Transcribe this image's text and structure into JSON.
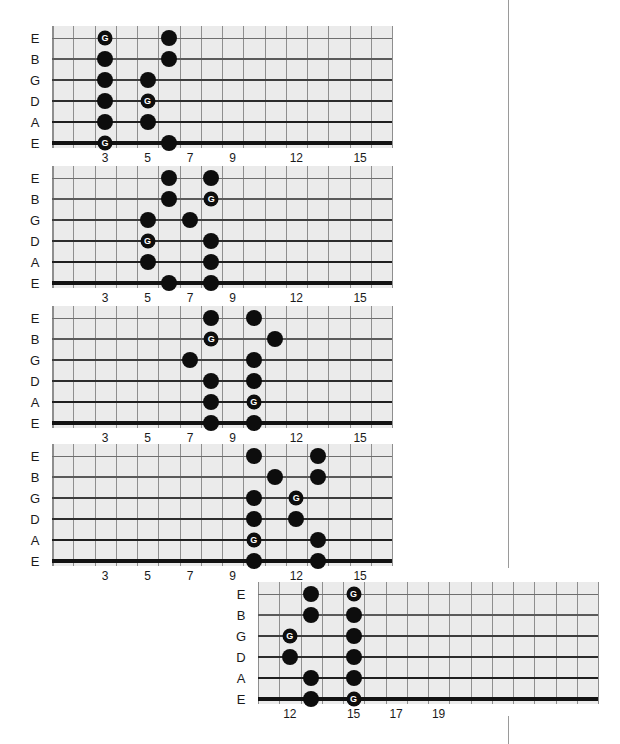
{
  "page": {
    "background_color": "#ffffff",
    "divider_color": "#9a9a9a",
    "board_color": "#ebebeb",
    "dot_color": "#0d0d0d",
    "root_label_color": "#ffffff",
    "string_color": "#232323",
    "fret_color": "#8e8e8e"
  },
  "dividers": [
    {
      "name": "page-divider-upper",
      "x": 508,
      "y": 0,
      "height": 568
    },
    {
      "name": "page-divider-lower",
      "x": 508,
      "y": 716,
      "height": 28
    }
  ],
  "string_names": [
    "E",
    "B",
    "G",
    "D",
    "A",
    "E"
  ],
  "diagrams": [
    {
      "id": "position-1",
      "name": "fretboard-diagram-1",
      "left": 24,
      "top": 26,
      "board_left": 28,
      "board_top": 0,
      "board_width": 340,
      "board_height": 122,
      "start_fret": 0,
      "fret_count": 16,
      "string_labels": [
        "E",
        "B",
        "G",
        "D",
        "A",
        "E"
      ],
      "fret_numbers": [
        {
          "fret": 3,
          "label": "3"
        },
        {
          "fret": 5,
          "label": "5"
        },
        {
          "fret": 7,
          "label": "7"
        },
        {
          "fret": 9,
          "label": "9"
        },
        {
          "fret": 12,
          "label": "12"
        },
        {
          "fret": 15,
          "label": "15"
        }
      ],
      "dots": [
        {
          "string": 1,
          "fret": 3,
          "root": true,
          "label": "G"
        },
        {
          "string": 1,
          "fret": 6,
          "root": false,
          "label": ""
        },
        {
          "string": 2,
          "fret": 3,
          "root": false,
          "label": ""
        },
        {
          "string": 2,
          "fret": 6,
          "root": false,
          "label": ""
        },
        {
          "string": 3,
          "fret": 3,
          "root": false,
          "label": ""
        },
        {
          "string": 3,
          "fret": 5,
          "root": false,
          "label": ""
        },
        {
          "string": 4,
          "fret": 3,
          "root": false,
          "label": ""
        },
        {
          "string": 4,
          "fret": 5,
          "root": true,
          "label": "G"
        },
        {
          "string": 5,
          "fret": 3,
          "root": false,
          "label": ""
        },
        {
          "string": 5,
          "fret": 5,
          "root": false,
          "label": ""
        },
        {
          "string": 6,
          "fret": 3,
          "root": true,
          "label": "G"
        },
        {
          "string": 6,
          "fret": 6,
          "root": false,
          "label": ""
        }
      ]
    },
    {
      "id": "position-2",
      "name": "fretboard-diagram-2",
      "left": 24,
      "top": 166,
      "board_left": 28,
      "board_top": 0,
      "board_width": 340,
      "board_height": 122,
      "start_fret": 0,
      "fret_count": 16,
      "string_labels": [
        "E",
        "B",
        "G",
        "D",
        "A",
        "E"
      ],
      "fret_numbers": [
        {
          "fret": 3,
          "label": "3"
        },
        {
          "fret": 5,
          "label": "5"
        },
        {
          "fret": 7,
          "label": "7"
        },
        {
          "fret": 9,
          "label": "9"
        },
        {
          "fret": 12,
          "label": "12"
        },
        {
          "fret": 15,
          "label": "15"
        }
      ],
      "dots": [
        {
          "string": 1,
          "fret": 6,
          "root": false,
          "label": ""
        },
        {
          "string": 1,
          "fret": 8,
          "root": false,
          "label": ""
        },
        {
          "string": 2,
          "fret": 6,
          "root": false,
          "label": ""
        },
        {
          "string": 2,
          "fret": 8,
          "root": true,
          "label": "G"
        },
        {
          "string": 3,
          "fret": 5,
          "root": false,
          "label": ""
        },
        {
          "string": 3,
          "fret": 7,
          "root": false,
          "label": ""
        },
        {
          "string": 4,
          "fret": 5,
          "root": true,
          "label": "G"
        },
        {
          "string": 4,
          "fret": 8,
          "root": false,
          "label": ""
        },
        {
          "string": 5,
          "fret": 5,
          "root": false,
          "label": ""
        },
        {
          "string": 5,
          "fret": 8,
          "root": false,
          "label": ""
        },
        {
          "string": 6,
          "fret": 6,
          "root": false,
          "label": ""
        },
        {
          "string": 6,
          "fret": 8,
          "root": false,
          "label": ""
        }
      ]
    },
    {
      "id": "position-3",
      "name": "fretboard-diagram-3",
      "left": 24,
      "top": 306,
      "board_left": 28,
      "board_top": 0,
      "board_width": 340,
      "board_height": 122,
      "start_fret": 0,
      "fret_count": 16,
      "string_labels": [
        "E",
        "B",
        "G",
        "D",
        "A",
        "E"
      ],
      "fret_numbers": [
        {
          "fret": 3,
          "label": "3"
        },
        {
          "fret": 5,
          "label": "5"
        },
        {
          "fret": 7,
          "label": "7"
        },
        {
          "fret": 9,
          "label": "9"
        },
        {
          "fret": 12,
          "label": "12"
        },
        {
          "fret": 15,
          "label": "15"
        }
      ],
      "dots": [
        {
          "string": 1,
          "fret": 8,
          "root": false,
          "label": ""
        },
        {
          "string": 1,
          "fret": 10,
          "root": false,
          "label": ""
        },
        {
          "string": 2,
          "fret": 8,
          "root": true,
          "label": "G"
        },
        {
          "string": 2,
          "fret": 11,
          "root": false,
          "label": ""
        },
        {
          "string": 3,
          "fret": 7,
          "root": false,
          "label": ""
        },
        {
          "string": 3,
          "fret": 10,
          "root": false,
          "label": ""
        },
        {
          "string": 4,
          "fret": 8,
          "root": false,
          "label": ""
        },
        {
          "string": 4,
          "fret": 10,
          "root": false,
          "label": ""
        },
        {
          "string": 5,
          "fret": 8,
          "root": false,
          "label": ""
        },
        {
          "string": 5,
          "fret": 10,
          "root": true,
          "label": "G"
        },
        {
          "string": 6,
          "fret": 8,
          "root": false,
          "label": ""
        },
        {
          "string": 6,
          "fret": 10,
          "root": false,
          "label": ""
        }
      ]
    },
    {
      "id": "position-4",
      "name": "fretboard-diagram-4",
      "left": 24,
      "top": 444,
      "board_left": 28,
      "board_top": 0,
      "board_width": 340,
      "board_height": 122,
      "start_fret": 0,
      "fret_count": 16,
      "string_labels": [
        "E",
        "B",
        "G",
        "D",
        "A",
        "E"
      ],
      "fret_numbers": [
        {
          "fret": 3,
          "label": "3"
        },
        {
          "fret": 5,
          "label": "5"
        },
        {
          "fret": 7,
          "label": "7"
        },
        {
          "fret": 9,
          "label": "9"
        },
        {
          "fret": 12,
          "label": "12"
        },
        {
          "fret": 15,
          "label": "15"
        }
      ],
      "dots": [
        {
          "string": 1,
          "fret": 10,
          "root": false,
          "label": ""
        },
        {
          "string": 1,
          "fret": 13,
          "root": false,
          "label": ""
        },
        {
          "string": 2,
          "fret": 11,
          "root": false,
          "label": ""
        },
        {
          "string": 2,
          "fret": 13,
          "root": false,
          "label": ""
        },
        {
          "string": 3,
          "fret": 10,
          "root": false,
          "label": ""
        },
        {
          "string": 3,
          "fret": 12,
          "root": true,
          "label": "G"
        },
        {
          "string": 4,
          "fret": 10,
          "root": false,
          "label": ""
        },
        {
          "string": 4,
          "fret": 12,
          "root": false,
          "label": ""
        },
        {
          "string": 5,
          "fret": 10,
          "root": true,
          "label": "G"
        },
        {
          "string": 5,
          "fret": 13,
          "root": false,
          "label": ""
        },
        {
          "string": 6,
          "fret": 10,
          "root": false,
          "label": ""
        },
        {
          "string": 6,
          "fret": 13,
          "root": false,
          "label": ""
        }
      ]
    },
    {
      "id": "position-5",
      "name": "fretboard-diagram-5",
      "left": 230,
      "top": 582,
      "board_left": 28,
      "board_top": 0,
      "board_width": 340,
      "board_height": 122,
      "start_fret": 10,
      "fret_count": 16,
      "string_labels": [
        "E",
        "B",
        "G",
        "D",
        "A",
        "E"
      ],
      "fret_numbers": [
        {
          "fret": 12,
          "label": "12"
        },
        {
          "fret": 15,
          "label": "15"
        },
        {
          "fret": 17,
          "label": "17"
        },
        {
          "fret": 19,
          "label": "19"
        }
      ],
      "dots": [
        {
          "string": 1,
          "fret": 13,
          "root": false,
          "label": ""
        },
        {
          "string": 1,
          "fret": 15,
          "root": true,
          "label": "G"
        },
        {
          "string": 2,
          "fret": 13,
          "root": false,
          "label": ""
        },
        {
          "string": 2,
          "fret": 15,
          "root": false,
          "label": ""
        },
        {
          "string": 3,
          "fret": 12,
          "root": true,
          "label": "G"
        },
        {
          "string": 3,
          "fret": 15,
          "root": false,
          "label": ""
        },
        {
          "string": 4,
          "fret": 12,
          "root": false,
          "label": ""
        },
        {
          "string": 4,
          "fret": 15,
          "root": false,
          "label": ""
        },
        {
          "string": 5,
          "fret": 13,
          "root": false,
          "label": ""
        },
        {
          "string": 5,
          "fret": 15,
          "root": false,
          "label": ""
        },
        {
          "string": 6,
          "fret": 13,
          "root": false,
          "label": ""
        },
        {
          "string": 6,
          "fret": 15,
          "root": true,
          "label": "G"
        }
      ]
    }
  ]
}
